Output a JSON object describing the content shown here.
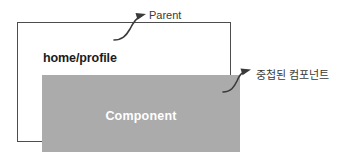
{
  "diagram": {
    "parent_container": {
      "route_label": "home/profile"
    },
    "nested_component": {
      "label": "Component",
      "fill_color": "#ababab",
      "text_color": "#ffffff"
    },
    "annotations": [
      {
        "id": "parent",
        "label": "Parent",
        "points_to": "parent-container-box"
      },
      {
        "id": "nested",
        "label": "중첩된 컴포넌트",
        "points_to": "nested-component-box"
      }
    ],
    "colors": {
      "border": "#4d4d4d",
      "annotation": "#3a3a3a",
      "background": "#ffffff"
    }
  }
}
